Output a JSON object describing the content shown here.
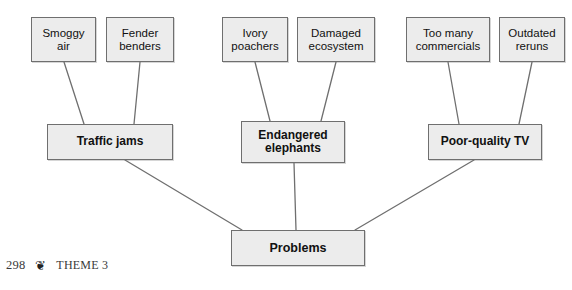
{
  "diagram": {
    "type": "concept-map",
    "orientation": "bottom-up",
    "root": {
      "id": "problems",
      "label": "Problems",
      "x": 231,
      "y": 230,
      "width": 134,
      "height": 36
    },
    "branches": [
      {
        "id": "traffic-jams",
        "label": "Traffic jams",
        "x": 47,
        "y": 124,
        "width": 126,
        "height": 36,
        "causes": [
          {
            "id": "smoggy-air",
            "label": "Smoggy\nair",
            "x": 31,
            "y": 17,
            "width": 65,
            "height": 45
          },
          {
            "id": "fender-benders",
            "label": "Fender\nbenders",
            "x": 106,
            "y": 17,
            "width": 68,
            "height": 45
          }
        ]
      },
      {
        "id": "endangered-elephants",
        "label": "Endangered\nelephants",
        "x": 241,
        "y": 121,
        "width": 104,
        "height": 42,
        "causes": [
          {
            "id": "ivory-poachers",
            "label": "Ivory\npoachers",
            "x": 222,
            "y": 17,
            "width": 66,
            "height": 45
          },
          {
            "id": "damaged-ecosystem",
            "label": "Damaged\necosystem",
            "x": 297,
            "y": 17,
            "width": 78,
            "height": 45
          }
        ]
      },
      {
        "id": "poor-quality-tv",
        "label": "Poor-quality TV",
        "x": 428,
        "y": 124,
        "width": 114,
        "height": 36,
        "causes": [
          {
            "id": "too-many-commercials",
            "label": "Too many\ncommercials",
            "x": 406,
            "y": 17,
            "width": 84,
            "height": 45
          },
          {
            "id": "outdated-reruns",
            "label": "Outdated\nreruns",
            "x": 499,
            "y": 17,
            "width": 66,
            "height": 45
          }
        ]
      }
    ],
    "connectors": [
      {
        "from": "smoggy-air",
        "to": "traffic-jams",
        "x1": 64,
        "y1": 62,
        "x2": 84,
        "y2": 124
      },
      {
        "from": "fender-benders",
        "to": "traffic-jams",
        "x1": 140,
        "y1": 62,
        "x2": 134,
        "y2": 124
      },
      {
        "from": "ivory-poachers",
        "to": "endangered-elephants",
        "x1": 255,
        "y1": 62,
        "x2": 270,
        "y2": 121
      },
      {
        "from": "damaged-ecosystem",
        "to": "endangered-elephants",
        "x1": 336,
        "y1": 62,
        "x2": 321,
        "y2": 121
      },
      {
        "from": "too-many-commercials",
        "to": "poor-quality-tv",
        "x1": 448,
        "y1": 62,
        "x2": 459,
        "y2": 124
      },
      {
        "from": "outdated-reruns",
        "to": "poor-quality-tv",
        "x1": 532,
        "y1": 62,
        "x2": 519,
        "y2": 124
      },
      {
        "from": "traffic-jams",
        "to": "problems",
        "x1": 125,
        "y1": 160,
        "x2": 242,
        "y2": 230
      },
      {
        "from": "endangered-elephants",
        "to": "problems",
        "x1": 294,
        "y1": 163,
        "x2": 296,
        "y2": 230
      },
      {
        "from": "poor-quality-tv",
        "to": "problems",
        "x1": 474,
        "y1": 160,
        "x2": 355,
        "y2": 230
      }
    ],
    "style": {
      "box_fill": "#ececec",
      "box_border": "#6f6f6f",
      "connector_color": "#6f6f6f",
      "text_color": "#111111",
      "page_background": "#ffffff"
    }
  },
  "footer": {
    "page_number": "298",
    "ornament_icon": "leaf-ornament-icon",
    "ornament_glyph": "❦",
    "theme_label": "THEME 3"
  }
}
